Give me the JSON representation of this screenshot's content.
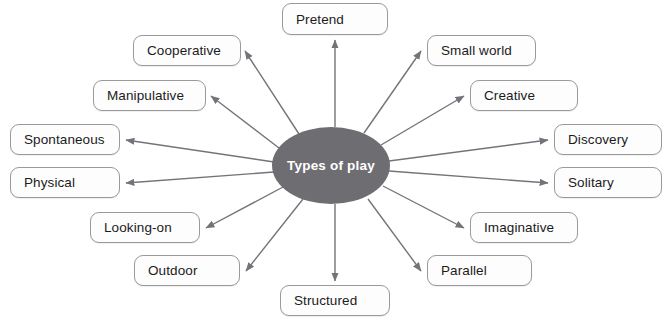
{
  "diagram": {
    "title": "Types of play",
    "type": "radial-mind-map",
    "center": {
      "label": "Types of play",
      "shape": "ellipse",
      "fill": "#6e6e72",
      "text_color": "#ffffff",
      "x": 272,
      "y": 127,
      "w": 118,
      "h": 77
    },
    "edge_color": "#73737a",
    "node_fill": "#fdfdfd",
    "node_border": "#9a9a9a",
    "node_text_color": "#1b1b1b",
    "background": "#ffffff",
    "nodes": [
      {
        "label": "Pretend",
        "x": 282,
        "y": 3,
        "w": 106,
        "h": 32,
        "anchor": "bottom"
      },
      {
        "label": "Cooperative",
        "x": 133,
        "y": 35,
        "w": 108,
        "h": 31,
        "anchor": "right"
      },
      {
        "label": "Manipulative",
        "x": 93,
        "y": 80,
        "w": 113,
        "h": 31,
        "anchor": "right"
      },
      {
        "label": "Spontaneous",
        "x": 10,
        "y": 124,
        "w": 110,
        "h": 31,
        "anchor": "right"
      },
      {
        "label": "Physical",
        "x": 10,
        "y": 167,
        "w": 110,
        "h": 31,
        "anchor": "right"
      },
      {
        "label": "Looking-on",
        "x": 90,
        "y": 212,
        "w": 110,
        "h": 31,
        "anchor": "right"
      },
      {
        "label": "Outdoor",
        "x": 134,
        "y": 255,
        "w": 106,
        "h": 31,
        "anchor": "right"
      },
      {
        "label": "Structured",
        "x": 280,
        "y": 285,
        "w": 110,
        "h": 31,
        "anchor": "top"
      },
      {
        "label": "Parallel",
        "x": 427,
        "y": 255,
        "w": 105,
        "h": 31,
        "anchor": "left"
      },
      {
        "label": "Imaginative",
        "x": 470,
        "y": 212,
        "w": 108,
        "h": 31,
        "anchor": "left"
      },
      {
        "label": "Solitary",
        "x": 554,
        "y": 167,
        "w": 108,
        "h": 31,
        "anchor": "left"
      },
      {
        "label": "Discovery",
        "x": 554,
        "y": 124,
        "w": 108,
        "h": 31,
        "anchor": "left"
      },
      {
        "label": "Creative",
        "x": 470,
        "y": 80,
        "w": 108,
        "h": 31,
        "anchor": "left"
      },
      {
        "label": "Small world",
        "x": 427,
        "y": 35,
        "w": 109,
        "h": 31,
        "anchor": "left"
      }
    ],
    "edges": [
      {
        "from": "Types of play",
        "to": "Pretend",
        "x1": 335,
        "y1": 127,
        "x2": 335,
        "y2": 40
      },
      {
        "from": "Types of play",
        "to": "Cooperative",
        "x1": 299,
        "y1": 134,
        "x2": 245,
        "y2": 51
      },
      {
        "from": "Types of play",
        "to": "Manipulative",
        "x1": 279,
        "y1": 148,
        "x2": 211,
        "y2": 96
      },
      {
        "from": "Types of play",
        "to": "Spontaneous",
        "x1": 274,
        "y1": 162,
        "x2": 126,
        "y2": 140
      },
      {
        "from": "Types of play",
        "to": "Physical",
        "x1": 274,
        "y1": 172,
        "x2": 126,
        "y2": 183
      },
      {
        "from": "Types of play",
        "to": "Looking-on",
        "x1": 283,
        "y1": 187,
        "x2": 206,
        "y2": 228
      },
      {
        "from": "Types of play",
        "to": "Outdoor",
        "x1": 303,
        "y1": 199,
        "x2": 246,
        "y2": 271
      },
      {
        "from": "Types of play",
        "to": "Structured",
        "x1": 335,
        "y1": 204,
        "x2": 335,
        "y2": 281
      },
      {
        "from": "Types of play",
        "to": "Parallel",
        "x1": 368,
        "y1": 199,
        "x2": 421,
        "y2": 271
      },
      {
        "from": "Types of play",
        "to": "Imaginative",
        "x1": 383,
        "y1": 186,
        "x2": 464,
        "y2": 228
      },
      {
        "from": "Types of play",
        "to": "Solitary",
        "x1": 389,
        "y1": 171,
        "x2": 548,
        "y2": 183
      },
      {
        "from": "Types of play",
        "to": "Discovery",
        "x1": 389,
        "y1": 161,
        "x2": 548,
        "y2": 140
      },
      {
        "from": "Types of play",
        "to": "Creative",
        "x1": 381,
        "y1": 145,
        "x2": 464,
        "y2": 96
      },
      {
        "from": "Types of play",
        "to": "Small world",
        "x1": 364,
        "y1": 133,
        "x2": 421,
        "y2": 51
      }
    ]
  }
}
